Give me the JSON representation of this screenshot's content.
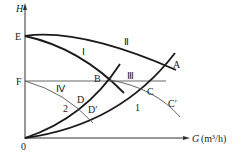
{
  "diagram": {
    "type": "pump and pipe-network characteristic curves",
    "axes": {
      "y_label": "H",
      "x_label_var": "G",
      "x_label_unit": "(m³/h)",
      "origin_label": "0"
    },
    "points": {
      "E": "E",
      "F": "F",
      "A": "A",
      "B": "B",
      "C": "C",
      "C_prime": "C′",
      "D": "D",
      "D_prime": "D′"
    },
    "curve_labels": {
      "I": "Ⅰ",
      "II": "Ⅱ",
      "III": "Ⅲ",
      "IV": "Ⅳ",
      "system_1": "1",
      "system_2": "2"
    },
    "colors": {
      "thick_line": "#1a1a1a",
      "thin_line": "#555555",
      "axis": "#333333"
    }
  }
}
